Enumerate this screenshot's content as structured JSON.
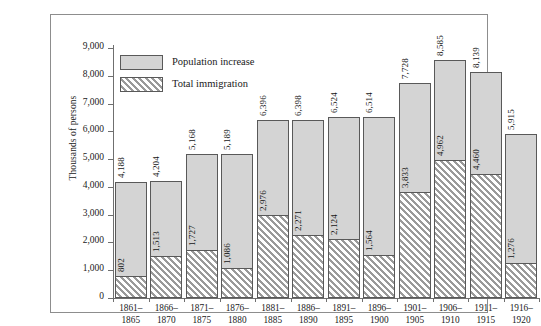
{
  "chart_data": {
    "type": "bar",
    "title": "",
    "subtitle": "",
    "xlabel": "",
    "ylabel": "Thousands of persons",
    "ylim": [
      0,
      9000
    ],
    "ytick_labels": [
      "0",
      "1,000",
      "2,000",
      "3,000",
      "4,000",
      "5,000",
      "6,000",
      "7,000",
      "8,000",
      "9,000"
    ],
    "ytick_values": [
      0,
      1000,
      2000,
      3000,
      4000,
      5000,
      6000,
      7000,
      8000,
      9000
    ],
    "grid": false,
    "legend_position": "upper-left",
    "bar_style": "overlaid",
    "categories": [
      "1861–1865",
      "1866–1870",
      "1871–1875",
      "1876–1880",
      "1881–1885",
      "1886–1890",
      "1891–1895",
      "1896–1900",
      "1901–1905",
      "1906–1910",
      "1911–1915",
      "1916–1920"
    ],
    "category_lines": [
      [
        "1861–",
        "1865"
      ],
      [
        "1866–",
        "1870"
      ],
      [
        "1871–",
        "1875"
      ],
      [
        "1876–",
        "1880"
      ],
      [
        "1881–",
        "1885"
      ],
      [
        "1886–",
        "1890"
      ],
      [
        "1891–",
        "1895"
      ],
      [
        "1896–",
        "1900"
      ],
      [
        "1901–",
        "1905"
      ],
      [
        "1906–",
        "1910"
      ],
      [
        "1911–",
        "1915"
      ],
      [
        "1916–",
        "1920"
      ]
    ],
    "series": [
      {
        "name": "Population increase",
        "pattern": "solid",
        "color": "#d4d4d4",
        "values": [
          4188,
          4204,
          5168,
          5189,
          6396,
          6398,
          6524,
          6514,
          7728,
          8585,
          8139,
          5915
        ],
        "labels": [
          "4,188",
          "4,204",
          "5,168",
          "5,189",
          "6,396",
          "6,398",
          "6,524",
          "6,514",
          "7,728",
          "8,585",
          "8,139",
          "5,915"
        ]
      },
      {
        "name": "Total immigration",
        "pattern": "diagonal-hatch",
        "color": "#e2e2e2",
        "values": [
          802,
          1513,
          1727,
          1086,
          2976,
          2271,
          2124,
          1564,
          3833,
          4962,
          4460,
          1276
        ],
        "labels": [
          "802",
          "1,513",
          "1,727",
          "1,086",
          "2,976",
          "2,271",
          "2,124",
          "1,564",
          "3,833",
          "4,962",
          "4,460",
          "1,276"
        ]
      }
    ]
  },
  "legend": {
    "items": [
      {
        "label": "Population increase",
        "swatch": "solid"
      },
      {
        "label": "Total immigration",
        "swatch": "hatch"
      }
    ]
  }
}
